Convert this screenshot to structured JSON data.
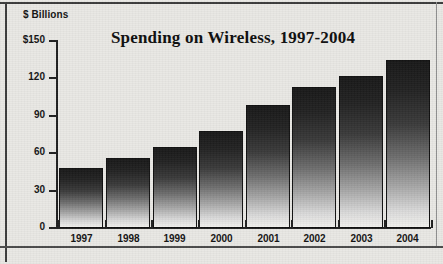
{
  "chart_data": {
    "type": "bar",
    "title": "Spending on Wireless, 1997-2004",
    "xlabel": "",
    "ylabel": "$ Billions",
    "categories": [
      "1997",
      "1998",
      "1999",
      "2000",
      "2001",
      "2002",
      "2003",
      "2004"
    ],
    "values": [
      48,
      56,
      65,
      78,
      99,
      113,
      122,
      135
    ],
    "ylim": [
      0,
      150
    ],
    "yticks": [
      0,
      30,
      60,
      90,
      120,
      150
    ],
    "ytick_labels": [
      "0",
      "30",
      "60",
      "90",
      "120",
      "$150"
    ],
    "grid": false,
    "legend": null,
    "series": [
      {
        "name": "Spending on Wireless",
        "values": [
          48,
          56,
          65,
          78,
          99,
          113,
          122,
          135
        ]
      }
    ]
  },
  "colors": {
    "background": "#e9e8e4",
    "axis": "#202020",
    "text": "#131313",
    "bar_top": "#181818",
    "bar_bottom": "#f2f1ee",
    "frame": "#3b3b3b"
  }
}
